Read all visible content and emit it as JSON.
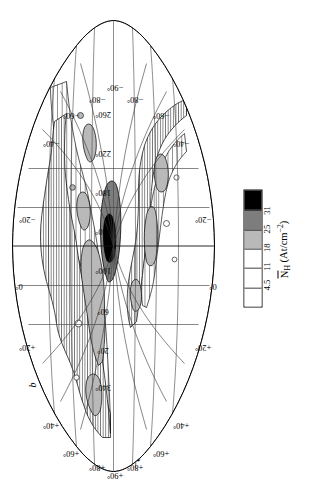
{
  "figure": {
    "title": "−80 < V < −30 km/sec",
    "projection": "aitoff",
    "latitude_axis_symbol": "b"
  },
  "legend": {
    "axis_label_prefix": "N",
    "axis_label_sub": "H",
    "axis_label_units": "(At/cm",
    "axis_label_units_sup": "−2",
    "axis_label_units_end": ")",
    "ticks": [
      "4.5",
      "11",
      "18",
      "25",
      "31"
    ],
    "swatches": [
      {
        "name": "blank",
        "fill": "#ffffff",
        "pattern": "none"
      },
      {
        "name": "coarse-hatch",
        "fill": "#ffffff",
        "pattern": "hatch-coarse"
      },
      {
        "name": "fine-hatch",
        "fill": "#ffffff",
        "pattern": "hatch-fine"
      },
      {
        "name": "light-gray",
        "fill": "#b9b9b9",
        "pattern": "solid"
      },
      {
        "name": "dark-gray",
        "fill": "#7d7d7d",
        "pattern": "solid"
      },
      {
        "name": "black",
        "fill": "#000000",
        "pattern": "solid"
      }
    ]
  },
  "chart_data": {
    "type": "heatmap",
    "title": "−80 < V < −30 km/sec",
    "xlabel": "Galactic longitude l",
    "ylabel": "Galactic latitude b",
    "legend_title": "N_H (At/cm^-2)",
    "projection": "aitoff",
    "xlim": [
      0,
      360
    ],
    "ylim": [
      -90,
      90
    ],
    "grid": true,
    "legend_position": "right",
    "contour_levels": [
      4.5,
      11,
      18,
      25,
      31
    ],
    "level_units": "10^18 At/cm^-2",
    "longitude_ticks": [
      "340°",
      "20°",
      "60°",
      "100°",
      "140°",
      "180°",
      "220°",
      "260°"
    ],
    "longitude_tick_values": [
      340,
      20,
      60,
      100,
      140,
      180,
      220,
      260
    ],
    "latitude_ticks_north": [
      "+20°",
      "+40°",
      "+60°",
      "+80°",
      "+90°"
    ],
    "latitude_ticks_south": [
      "−20°",
      "−40°",
      "−60°",
      "−80°",
      "−90°"
    ],
    "peak_feature": {
      "longitude": 130,
      "latitude": 38,
      "level": 31,
      "label": "black"
    }
  },
  "graticule": {
    "top_labels": [
      {
        "text": "+40°",
        "x": 62,
        "y": 46,
        "rot": -90
      },
      {
        "text": "+20°",
        "x": 140,
        "y": 22,
        "rot": -90
      },
      {
        "text": "0°",
        "x": 205,
        "y": 14,
        "rot": -90
      },
      {
        "text": "−20°",
        "x": 268,
        "y": 22,
        "rot": -90
      },
      {
        "text": "−40°",
        "x": 344,
        "y": 46,
        "rot": -90
      }
    ],
    "bottom_labels": [
      {
        "text": "+40°",
        "x": 62,
        "y": 176,
        "rot": -90
      },
      {
        "text": "+20°",
        "x": 140,
        "y": 198,
        "rot": -90
      },
      {
        "text": "0°",
        "x": 205,
        "y": 208,
        "rot": -90
      },
      {
        "text": "−20°",
        "x": 268,
        "y": 198,
        "rot": -90
      },
      {
        "text": "−40°",
        "x": 344,
        "y": 176,
        "rot": -90
      }
    ],
    "left_labels": [
      {
        "text": "+60°",
        "x": 34,
        "y": 66
      },
      {
        "text": "+80°",
        "x": 20,
        "y": 92
      },
      {
        "text": "+90°",
        "x": 12,
        "y": 110
      },
      {
        "text": "+80°",
        "x": 20,
        "y": 130
      },
      {
        "text": "+60°",
        "x": 34,
        "y": 156
      }
    ],
    "right_labels": [
      {
        "text": "−60°",
        "x": 372,
        "y": 66
      },
      {
        "text": "−80°",
        "x": 388,
        "y": 92
      },
      {
        "text": "−90°",
        "x": 400,
        "y": 110
      },
      {
        "text": "−80°",
        "x": 388,
        "y": 130
      },
      {
        "text": "−60°",
        "x": 372,
        "y": 156
      }
    ],
    "meridian_labels": [
      {
        "text": "340°",
        "x": 100
      },
      {
        "text": "20°",
        "x": 139
      },
      {
        "text": "60°",
        "x": 178
      },
      {
        "text": "100°",
        "x": 217
      },
      {
        "text": "140°",
        "x": 256
      },
      {
        "text": "180°",
        "x": 295
      },
      {
        "text": "220°",
        "x": 334
      },
      {
        "text": "260°",
        "x": 373
      }
    ]
  }
}
